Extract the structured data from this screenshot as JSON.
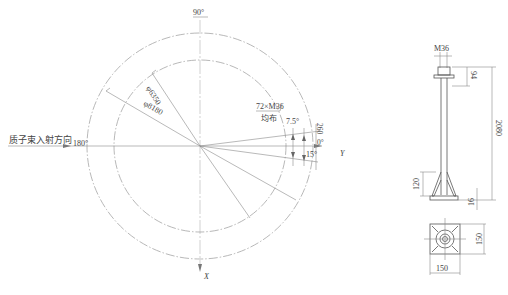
{
  "plan_view": {
    "angle_top": "90°",
    "angle_left": "180°",
    "angle_right": "0°",
    "angle_offset": "260",
    "outer_diameter": "φ8180",
    "inner_diameter": "φ6350",
    "bolt_spec": "72×M36",
    "bolt_distribution": "均布",
    "angle_small": "7.5°",
    "angle_large": "15°",
    "beam_direction_label": "质子束入射方向",
    "axis_y": "Y",
    "axis_x": "X"
  },
  "bolt_detail": {
    "thread_label": "M36",
    "nut_height": "94",
    "total_length": "2080",
    "base_height": "120",
    "plate_thickness": "16",
    "plate_width": "150",
    "plate_depth": "150"
  }
}
